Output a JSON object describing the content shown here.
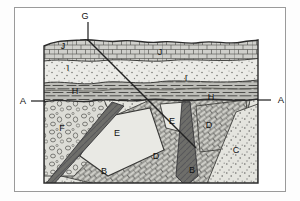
{
  "figure": {
    "kind": "geologic-block-cross-section",
    "title": "",
    "background_color": "#ffffff",
    "frame_color": "#9a9a9a",
    "line_color": "#2b2b2b"
  },
  "block": {
    "left": 44,
    "top": 33,
    "right": 258,
    "bottom": 183,
    "surface_description": "undulating erosional land surface"
  },
  "section_line": {
    "name": "A-A",
    "left_label": "A",
    "right_label": "A",
    "left_label_x": 23,
    "right_label_x": 281,
    "label_y": 104,
    "tick_y": 101,
    "description": "angular unconformity marked by A at both ends"
  },
  "fault": {
    "label": "G",
    "label_x": 85,
    "label_y": 17,
    "leader_from": [
      88,
      21
    ],
    "leader_to": [
      88,
      40
    ],
    "trace_from": [
      88,
      40
    ],
    "trace_to": [
      196,
      148
    ],
    "description": "fault plane trace cutting obliquely across the section"
  },
  "units": [
    {
      "id": "J",
      "label": "J",
      "pattern": "limestone-brick",
      "fill": "#cfcfcb",
      "labels": [
        {
          "x": 63,
          "y": 49
        },
        {
          "x": 160,
          "y": 54
        }
      ],
      "position": "uppermost bedded layer at the land surface"
    },
    {
      "id": "I",
      "label": "I",
      "pattern": "sandstone-stipple",
      "fill": "#ebebe7",
      "labels": [
        {
          "x": 68,
          "y": 70
        },
        {
          "x": 186,
          "y": 80
        }
      ],
      "position": "stippled sandstone layer beneath J"
    },
    {
      "id": "H",
      "label": "H",
      "pattern": "shale-dash",
      "fill": "#bdbdb8",
      "labels": [
        {
          "x": 75,
          "y": 93
        },
        {
          "x": 210,
          "y": 99
        }
      ],
      "position": "dashed shale layer directly above the A-A unconformity"
    },
    {
      "id": "F",
      "label": "F",
      "pattern": "conglomerate-pebble",
      "fill": "#dcdcd6",
      "labels": [
        {
          "x": 62,
          "y": 130
        }
      ],
      "position": "conglomerate body in the lower left, below the unconformity"
    },
    {
      "id": "E",
      "label": "E",
      "pattern": "plain-light",
      "fill": "#e9e9e4",
      "labels": [
        {
          "x": 117,
          "y": 135
        },
        {
          "x": 172,
          "y": 123
        }
      ],
      "position": "tilted light-toned block faulted into two exposures"
    },
    {
      "id": "D",
      "label": "D",
      "pattern": "tilted-brick",
      "fill": "#cdcdc7",
      "labels": [
        {
          "x": 156,
          "y": 158
        },
        {
          "x": 209,
          "y": 127
        }
      ],
      "position": "tilted bedded unit below and beside E"
    },
    {
      "id": "C",
      "label": "C",
      "pattern": "sandstone-stipple",
      "fill": "#e4e4de",
      "labels": [
        {
          "x": 235,
          "y": 152
        }
      ],
      "position": "stippled unit in the lower right corner"
    },
    {
      "id": "B",
      "label": "B",
      "pattern": "dark-intrusive",
      "fill": "#6e6e6a",
      "labels": [
        {
          "x": 104,
          "y": 173
        },
        {
          "x": 192,
          "y": 172
        }
      ],
      "position": "dark igneous dikes cutting the lower units"
    }
  ],
  "legend_notes": {
    "unit_ids": [
      "B",
      "C",
      "D",
      "E",
      "F",
      "G",
      "H",
      "I",
      "J",
      "A"
    ]
  }
}
